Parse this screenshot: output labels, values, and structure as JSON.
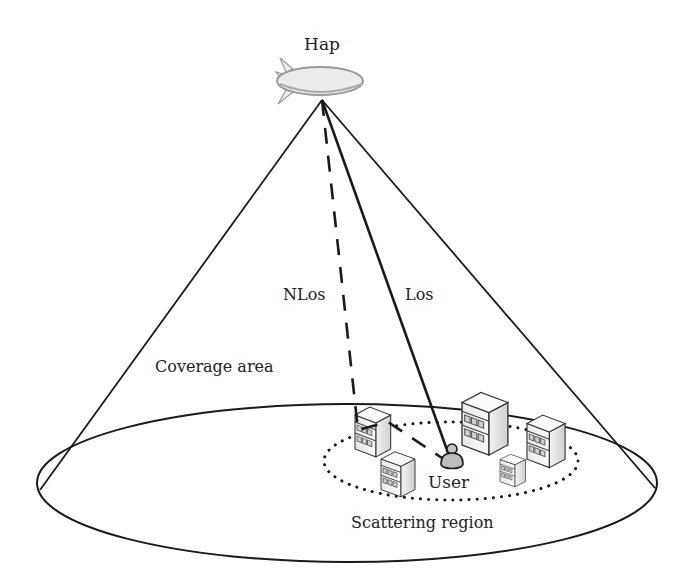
{
  "diagram": {
    "type": "HAP coverage geometry",
    "labels": {
      "hap": "Hap",
      "nlos": "NLos",
      "los": "Los",
      "coverage_area": "Coverage area",
      "user": "User",
      "scattering_region": "Scattering region"
    },
    "nodes": [
      {
        "id": "hap",
        "kind": "airship",
        "label": "Hap"
      },
      {
        "id": "user",
        "kind": "user-terminal",
        "label": "User"
      },
      {
        "id": "building-1",
        "kind": "building"
      },
      {
        "id": "building-2",
        "kind": "building"
      },
      {
        "id": "building-3",
        "kind": "building"
      },
      {
        "id": "building-4",
        "kind": "building"
      },
      {
        "id": "building-5",
        "kind": "building"
      }
    ],
    "edges": [
      {
        "from": "hap",
        "to": "user",
        "style": "solid",
        "label": "Los"
      },
      {
        "from": "hap",
        "to": "building-1",
        "style": "dashed",
        "label": "NLos"
      },
      {
        "from": "building-1",
        "to": "user",
        "style": "dashed"
      }
    ],
    "regions": [
      {
        "id": "coverage-area",
        "shape": "ellipse",
        "style": "solid",
        "label": "Coverage area"
      },
      {
        "id": "scattering-region",
        "shape": "ellipse",
        "style": "dotted",
        "label": "Scattering region"
      }
    ],
    "colors": {
      "stroke": "#1a1a1a",
      "text": "#222222",
      "airship_fill": "#ececec",
      "building_face": "#f2f2f2",
      "building_side": "#d8d8d8",
      "user_fill": "#bdbdbd"
    }
  }
}
